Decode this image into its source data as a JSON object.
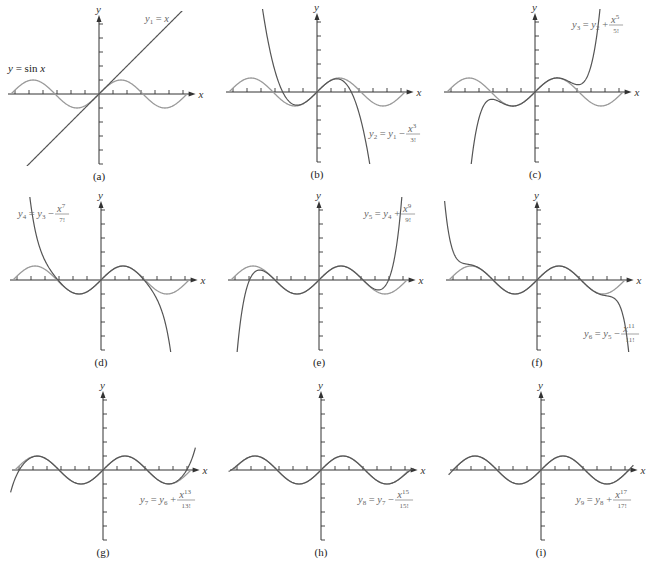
{
  "chart_data": [
    {
      "panel": "(a)",
      "type": "line",
      "origin_px": [
        99,
        94
      ],
      "series": [
        {
          "name": "y = sin x",
          "label_text": "y = sin x",
          "role": "sin"
        },
        {
          "name": "y1 = x",
          "degree": 1,
          "role": "approx"
        }
      ],
      "label": {
        "lhs": "y",
        "lhs_sub": "1",
        "rhs": "= x",
        "pos": [
          145,
          22
        ]
      },
      "sin_label": {
        "text": "y = sin x",
        "pos": [
          8,
          72
        ]
      },
      "xlabel": "x",
      "ylabel": "y",
      "x_ticks": [
        -6,
        -5,
        -4,
        -3,
        -2,
        -1,
        1,
        2,
        3,
        4,
        5,
        6
      ],
      "y_ticks": [
        -5,
        -4,
        -3,
        -2,
        -1,
        1,
        2,
        3,
        4,
        5
      ],
      "xlim": [
        -6.5,
        6.8
      ],
      "ylim": [
        -5,
        5.3
      ]
    },
    {
      "panel": "(b)",
      "type": "line",
      "origin_px": [
        317,
        92
      ],
      "series": [
        {
          "name": "y = sin x",
          "role": "sin"
        },
        {
          "name": "y2 = y1 − x^3/3!",
          "degree": 3,
          "role": "approx"
        }
      ],
      "label": {
        "lhs": "y",
        "lhs_sub": "2",
        "mid": "= y",
        "mid_sub": "1",
        "op": "−",
        "num": "x",
        "num_sup": "3",
        "den": "3!",
        "pos": [
          369,
          137
        ]
      },
      "xlabel": "x",
      "ylabel": "y",
      "xlim": [
        -6.5,
        6.8
      ],
      "ylim": [
        -5,
        5.3
      ]
    },
    {
      "panel": "(c)",
      "type": "line",
      "origin_px": [
        535,
        92
      ],
      "series": [
        {
          "name": "y = sin x",
          "role": "sin"
        },
        {
          "name": "y3 = y2 + x^5/5!",
          "degree": 5,
          "role": "approx"
        }
      ],
      "label": {
        "lhs": "y",
        "lhs_sub": "3",
        "mid": "= y",
        "mid_sub": "2",
        "op": "+",
        "num": "x",
        "num_sup": "5",
        "den": "5!",
        "pos": [
          572,
          28
        ]
      },
      "xlabel": "x",
      "ylabel": "y",
      "xlim": [
        -6.5,
        6.8
      ],
      "ylim": [
        -5,
        5.3
      ]
    },
    {
      "panel": "(d)",
      "type": "line",
      "origin_px": [
        101,
        280
      ],
      "series": [
        {
          "name": "y = sin x",
          "role": "sin"
        },
        {
          "name": "y4 = y3 − x^7/7!",
          "degree": 7,
          "role": "approx"
        }
      ],
      "label": {
        "lhs": "y",
        "lhs_sub": "4",
        "mid": "= y",
        "mid_sub": "3",
        "op": "−",
        "num": "x",
        "num_sup": "7",
        "den": "7!",
        "pos": [
          18,
          217
        ]
      },
      "xlabel": "x",
      "ylabel": "y",
      "xlim": [
        -6.5,
        6.8
      ],
      "ylim": [
        -5,
        5.3
      ]
    },
    {
      "panel": "(e)",
      "type": "line",
      "origin_px": [
        319,
        280
      ],
      "series": [
        {
          "name": "y = sin x",
          "role": "sin"
        },
        {
          "name": "y5 = y4 + x^9/9!",
          "degree": 9,
          "role": "approx"
        }
      ],
      "label": {
        "lhs": "y",
        "lhs_sub": "5",
        "mid": "= y",
        "mid_sub": "4",
        "op": "+",
        "num": "x",
        "num_sup": "9",
        "den": "9!",
        "pos": [
          364,
          217
        ]
      },
      "xlabel": "x",
      "ylabel": "y",
      "xlim": [
        -6.5,
        6.8
      ],
      "ylim": [
        -5,
        5.3
      ]
    },
    {
      "panel": "(f)",
      "type": "line",
      "origin_px": [
        537,
        280
      ],
      "series": [
        {
          "name": "y = sin x",
          "role": "sin"
        },
        {
          "name": "y6 = y5 − x^11/11!",
          "degree": 11,
          "role": "approx"
        }
      ],
      "label": {
        "lhs": "y",
        "lhs_sub": "6",
        "mid": "= y",
        "mid_sub": "5",
        "op": "−",
        "num": "x",
        "num_sup": "11",
        "den": "11!",
        "pos": [
          584,
          337
        ]
      },
      "xlabel": "x",
      "ylabel": "y",
      "xlim": [
        -6.5,
        6.8
      ],
      "ylim": [
        -5,
        5.3
      ]
    },
    {
      "panel": "(g)",
      "type": "line",
      "origin_px": [
        103,
        470
      ],
      "series": [
        {
          "name": "y = sin x",
          "role": "sin"
        },
        {
          "name": "y7 = y6 + x^13/13!",
          "degree": 13,
          "role": "approx"
        }
      ],
      "label": {
        "lhs": "y",
        "lhs_sub": "7",
        "mid": "= y",
        "mid_sub": "6",
        "op": "+",
        "num": "x",
        "num_sup": "13",
        "den": "13!",
        "pos": [
          140,
          503
        ]
      },
      "xlabel": "x",
      "ylabel": "y",
      "xlim": [
        -6.5,
        6.8
      ],
      "ylim": [
        -5,
        5.3
      ]
    },
    {
      "panel": "(h)",
      "type": "line",
      "origin_px": [
        321,
        470
      ],
      "series": [
        {
          "name": "y = sin x",
          "role": "sin"
        },
        {
          "name": "y8 = y7 − x^15/15!",
          "degree": 15,
          "role": "approx"
        }
      ],
      "label": {
        "lhs": "y",
        "lhs_sub": "8",
        "mid": "= y",
        "mid_sub": "7",
        "op": "−",
        "num": "x",
        "num_sup": "15",
        "den": "15!",
        "pos": [
          358,
          503
        ]
      },
      "xlabel": "x",
      "ylabel": "y",
      "xlim": [
        -6.5,
        6.8
      ],
      "ylim": [
        -5,
        5.3
      ]
    },
    {
      "panel": "(i)",
      "type": "line",
      "origin_px": [
        541,
        470
      ],
      "series": [
        {
          "name": "y = sin x",
          "role": "sin"
        },
        {
          "name": "y9 = y8 + x^17/17!",
          "degree": 17,
          "role": "approx"
        }
      ],
      "label": {
        "lhs": "y",
        "lhs_sub": "9",
        "mid": "= y",
        "mid_sub": "8",
        "op": "+",
        "num": "x",
        "num_sup": "17",
        "den": "17!",
        "pos": [
          576,
          503
        ]
      },
      "xlabel": "x",
      "ylabel": "y",
      "xlim": [
        -6.5,
        6.8
      ],
      "ylim": [
        -5,
        5.3
      ]
    }
  ],
  "layout": {
    "unit_px": 14,
    "x_ticks_each_side": 6,
    "y_ticks_each_side": 5,
    "panel_caption_offset_y": 86,
    "sin_range": [
      -6.28,
      6.28
    ]
  },
  "colors": {
    "axis": "#333333",
    "sin_curve": "#9a9a9a",
    "approx_curve": "#555555",
    "approx_curve_a": "#555555",
    "label_text": "#666666",
    "caption": "#222222"
  }
}
